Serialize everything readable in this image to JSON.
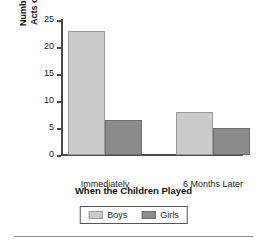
{
  "chart_data": {
    "type": "bar",
    "title": "",
    "xlabel": "When the Children Played",
    "ylabel_lines": [
      "Number of Imitative",
      "Acts of Aggression"
    ],
    "ylabel": "Number of Imitative Acts of Aggression",
    "categories": [
      "Immediately",
      "6 Months Later"
    ],
    "series": [
      {
        "name": "Boys",
        "color": "#cbcbcb",
        "values": [
          23,
          8
        ]
      },
      {
        "name": "Girls",
        "color": "#8b8b8b",
        "values": [
          6.5,
          5
        ]
      }
    ],
    "ylim": [
      0,
      25
    ],
    "yticks": [
      0,
      5,
      10,
      15,
      20,
      25
    ],
    "ytick_labels": [
      "0",
      "5",
      "10",
      "15",
      "20",
      "25"
    ],
    "grid": false,
    "legend_position": "bottom"
  },
  "legend": {
    "items": [
      {
        "label": "Boys",
        "color": "#cbcbcb"
      },
      {
        "label": "Girls",
        "color": "#8b8b8b"
      }
    ]
  }
}
